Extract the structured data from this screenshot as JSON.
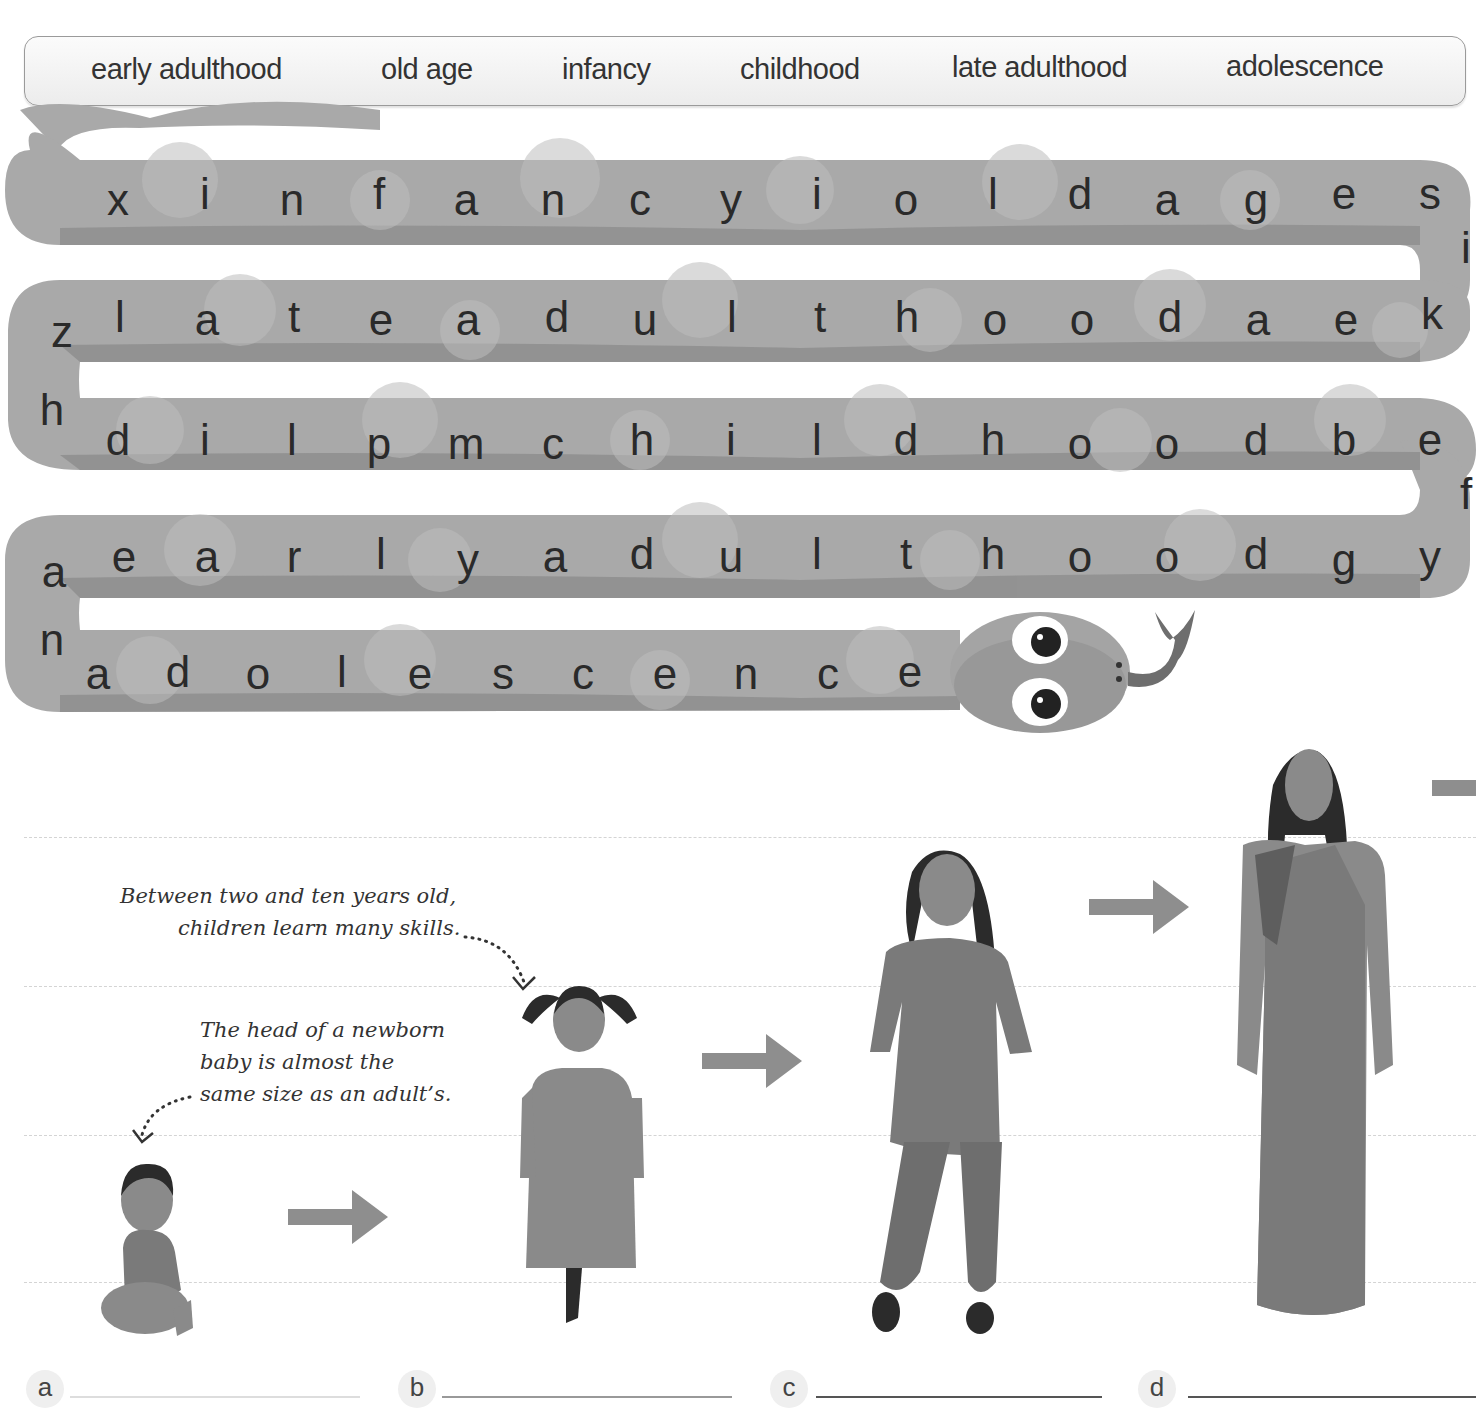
{
  "word_bank": {
    "words": [
      "early adulthood",
      "old age",
      "infancy",
      "childhood",
      "late adulthood",
      "adolescence"
    ]
  },
  "word_search": {
    "rows": [
      {
        "letters": [
          "x",
          "i",
          "n",
          "f",
          "a",
          "n",
          "c",
          "y",
          "i",
          "o",
          "l",
          "d",
          "a",
          "g",
          "e",
          "s"
        ]
      },
      {
        "letters": [
          "z",
          "l",
          "a",
          "t",
          "e",
          "a",
          "d",
          "u",
          "l",
          "t",
          "h",
          "o",
          "o",
          "d",
          "a",
          "e",
          "k"
        ]
      },
      {
        "letters": [
          "h",
          "d",
          "i",
          "l",
          "p",
          "m",
          "c",
          "h",
          "i",
          "l",
          "d",
          "h",
          "o",
          "o",
          "d",
          "b",
          "e"
        ]
      },
      {
        "letters": [
          "a",
          "e",
          "a",
          "r",
          "l",
          "y",
          "a",
          "d",
          "u",
          "l",
          "t",
          "h",
          "o",
          "o",
          "d",
          "g",
          "y"
        ]
      },
      {
        "letters": [
          "n",
          "a",
          "d",
          "o",
          "l",
          "e",
          "s",
          "c",
          "e",
          "n",
          "c",
          "e"
        ]
      }
    ],
    "turn_letters": [
      "i",
      "f"
    ]
  },
  "annotations": {
    "childhood_note_line1": "Between two and ten years old,",
    "childhood_note_line2": "children learn many skills.",
    "infancy_note_line1": "The head of a newborn",
    "infancy_note_line2": "baby is almost the",
    "infancy_note_line3": "same size as an adult’s."
  },
  "answers": [
    {
      "label": "a",
      "value": ""
    },
    {
      "label": "b",
      "value": ""
    },
    {
      "label": "c",
      "value": ""
    },
    {
      "label": "d",
      "value": ""
    }
  ],
  "colors": {
    "snake_body": "#a9a9a9",
    "snake_shadow": "#8f8f8f",
    "snake_spots": "#bdbdbd",
    "arrow": "#8e8e8e",
    "figure_skin": "#8a8a8a",
    "figure_hair": "#2b2b2b",
    "figure_cloth": "#7a7a7a"
  }
}
